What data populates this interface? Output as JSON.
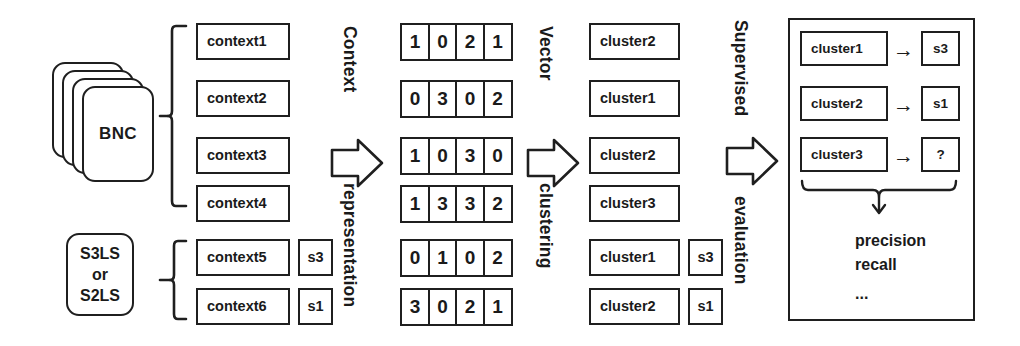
{
  "figure": {
    "stroke_color": "#1f1f1f",
    "background_color": "#ffffff"
  },
  "sources": {
    "corpus_stack_label": "BNC",
    "lexical_sample_label_line1": "S3LS",
    "lexical_sample_label_line2": "or",
    "lexical_sample_label_line3": "S2LS"
  },
  "contexts": [
    {
      "label": "context1",
      "sense": ""
    },
    {
      "label": "context2",
      "sense": ""
    },
    {
      "label": "context3",
      "sense": ""
    },
    {
      "label": "context4",
      "sense": ""
    },
    {
      "label": "context5",
      "sense": "s3"
    },
    {
      "label": "context6",
      "sense": "s1"
    }
  ],
  "stages": [
    {
      "top": "Context",
      "bottom": "representation"
    },
    {
      "top": "Vector",
      "bottom": "clustering"
    },
    {
      "top": "Supervised",
      "bottom": "evaluation"
    }
  ],
  "vectors": [
    [
      1,
      0,
      2,
      1
    ],
    [
      0,
      3,
      0,
      2
    ],
    [
      1,
      0,
      3,
      0
    ],
    [
      1,
      3,
      3,
      2
    ],
    [
      0,
      1,
      0,
      2
    ],
    [
      3,
      0,
      2,
      1
    ]
  ],
  "clusters": [
    {
      "label": "cluster2",
      "sense": ""
    },
    {
      "label": "cluster1",
      "sense": ""
    },
    {
      "label": "cluster2",
      "sense": ""
    },
    {
      "label": "cluster3",
      "sense": ""
    },
    {
      "label": "cluster1",
      "sense": "s3"
    },
    {
      "label": "cluster2",
      "sense": "s1"
    }
  ],
  "evaluation": {
    "mappings": [
      {
        "cluster": "cluster1",
        "arrow": "→",
        "sense": "s3"
      },
      {
        "cluster": "cluster2",
        "arrow": "→",
        "sense": "s1"
      },
      {
        "cluster": "cluster3",
        "arrow": "→",
        "sense": "?"
      }
    ],
    "metrics": [
      "precision",
      "recall",
      "..."
    ]
  }
}
